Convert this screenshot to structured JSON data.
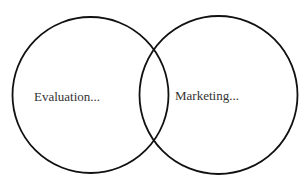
{
  "diagram": {
    "type": "venn",
    "stroke_color": "#111111",
    "text_color": "#333333",
    "circles": [
      {
        "id": "left",
        "label": "Evaluation..."
      },
      {
        "id": "right",
        "label": "Marketing..."
      }
    ]
  }
}
